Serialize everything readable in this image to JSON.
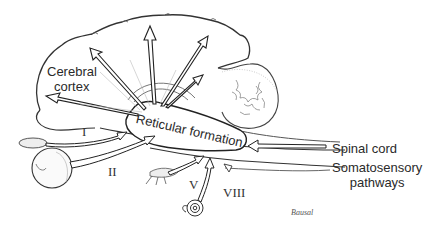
{
  "diagram": {
    "type": "neuroanatomy-illustration",
    "labels": {
      "cerebral_cortex_line1": "Cerebral",
      "cerebral_cortex_line2": "cortex",
      "reticular_formation": "Reticular formation",
      "spinal_cord": "Spinal cord",
      "somatosensory_line1": "Somatosensory",
      "somatosensory_line2": "pathways"
    },
    "cranial_nerves": {
      "olfactory": "I",
      "optic": "II",
      "trigeminal": "V",
      "vestibulocochlear": "VIII"
    },
    "signature": "Bausal",
    "structures": [
      "cerebral-cortex",
      "cerebellum",
      "brainstem",
      "eye",
      "olfactory-bulb",
      "cochlea",
      "trigeminal-ganglion"
    ],
    "arrows": {
      "ascending_to_cortex": 6,
      "inputs_to_reticular": [
        "olfactory",
        "optic",
        "trigeminal",
        "vestibulocochlear",
        "spinal-cord"
      ]
    },
    "colors": {
      "line": "#222222",
      "background": "#ffffff",
      "shade": "#bbbbbb"
    }
  }
}
